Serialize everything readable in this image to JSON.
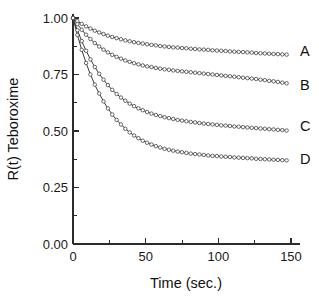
{
  "chart_data": {
    "type": "line",
    "title": "",
    "subtitle": "",
    "xlabel": "Time (sec.)",
    "ylabel": "R(t) Teboroxime",
    "xlim": [
      0,
      155
    ],
    "ylim": [
      0.0,
      1.05
    ],
    "xticks": [
      0,
      50,
      100,
      150
    ],
    "xtick_labels": [
      "0",
      "50",
      "100",
      "150"
    ],
    "yticks": [
      0.0,
      0.25,
      0.5,
      0.75,
      1.0
    ],
    "ytick_labels": [
      "0.00",
      "0.25",
      "0.50",
      "0.75",
      "1.00"
    ],
    "x_minor_ticks": [
      25,
      75,
      125
    ],
    "y_minor_ticks": [
      0.125,
      0.375,
      0.625,
      0.875
    ],
    "grid": false,
    "legend_position": "right-inline-labels",
    "marker": "open-circle",
    "annotations": [
      "A",
      "B",
      "C",
      "D"
    ],
    "x": [
      0,
      3,
      6,
      9,
      12,
      15,
      18,
      21,
      24,
      27,
      30,
      33,
      36,
      39,
      42,
      45,
      48,
      51,
      54,
      57,
      60,
      63,
      66,
      69,
      72,
      75,
      78,
      81,
      84,
      87,
      90,
      93,
      96,
      99,
      102,
      105,
      108,
      111,
      114,
      117,
      120,
      123,
      126,
      129,
      132,
      135,
      138,
      141,
      144,
      147
    ],
    "series": [
      {
        "name": "A",
        "label": "A",
        "label_y_value": 0.855,
        "values": [
          1.0,
          0.986,
          0.974,
          0.963,
          0.953,
          0.944,
          0.936,
          0.929,
          0.922,
          0.916,
          0.911,
          0.906,
          0.901,
          0.897,
          0.893,
          0.89,
          0.887,
          0.884,
          0.881,
          0.879,
          0.876,
          0.874,
          0.872,
          0.87,
          0.869,
          0.867,
          0.866,
          0.864,
          0.863,
          0.861,
          0.86,
          0.859,
          0.857,
          0.856,
          0.855,
          0.854,
          0.852,
          0.851,
          0.85,
          0.849,
          0.848,
          0.847,
          0.845,
          0.844,
          0.843,
          0.842,
          0.841,
          0.84,
          0.839,
          0.838
        ]
      },
      {
        "name": "B",
        "label": "B",
        "label_y_value": 0.705,
        "values": [
          1.0,
          0.973,
          0.948,
          0.926,
          0.907,
          0.889,
          0.874,
          0.86,
          0.848,
          0.837,
          0.828,
          0.82,
          0.812,
          0.806,
          0.8,
          0.795,
          0.79,
          0.786,
          0.783,
          0.779,
          0.776,
          0.773,
          0.771,
          0.768,
          0.766,
          0.764,
          0.762,
          0.76,
          0.758,
          0.756,
          0.754,
          0.752,
          0.75,
          0.748,
          0.746,
          0.744,
          0.742,
          0.74,
          0.738,
          0.736,
          0.734,
          0.732,
          0.73,
          0.727,
          0.725,
          0.722,
          0.72,
          0.717,
          0.714,
          0.711
        ]
      },
      {
        "name": "C",
        "label": "C",
        "label_y_value": 0.52,
        "values": [
          1.0,
          0.946,
          0.898,
          0.855,
          0.817,
          0.783,
          0.753,
          0.727,
          0.703,
          0.682,
          0.664,
          0.648,
          0.634,
          0.621,
          0.61,
          0.6,
          0.592,
          0.584,
          0.577,
          0.571,
          0.566,
          0.561,
          0.557,
          0.553,
          0.549,
          0.546,
          0.543,
          0.54,
          0.538,
          0.535,
          0.533,
          0.531,
          0.529,
          0.527,
          0.525,
          0.524,
          0.522,
          0.52,
          0.519,
          0.517,
          0.516,
          0.514,
          0.513,
          0.511,
          0.51,
          0.508,
          0.507,
          0.505,
          0.504,
          0.502
        ]
      },
      {
        "name": "D",
        "label": "D",
        "label_y_value": 0.375,
        "values": [
          1.0,
          0.925,
          0.859,
          0.801,
          0.75,
          0.705,
          0.666,
          0.631,
          0.6,
          0.573,
          0.549,
          0.529,
          0.51,
          0.494,
          0.48,
          0.468,
          0.457,
          0.448,
          0.44,
          0.433,
          0.427,
          0.421,
          0.417,
          0.413,
          0.409,
          0.406,
          0.403,
          0.4,
          0.398,
          0.396,
          0.394,
          0.392,
          0.39,
          0.389,
          0.387,
          0.386,
          0.385,
          0.383,
          0.382,
          0.381,
          0.38,
          0.379,
          0.377,
          0.376,
          0.375,
          0.374,
          0.373,
          0.372,
          0.371,
          0.37
        ]
      }
    ]
  }
}
